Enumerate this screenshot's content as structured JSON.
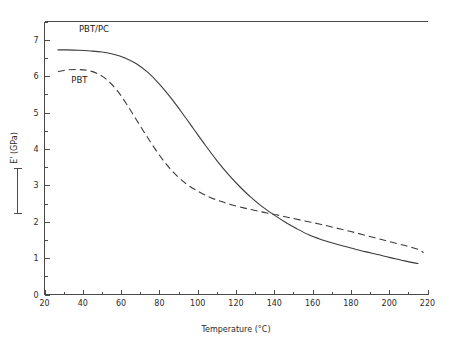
{
  "chart_data": {
    "type": "line",
    "title": "",
    "xlabel": "Temperature (°C)",
    "ylabel": "E' (GPa)",
    "xlim": [
      20,
      220
    ],
    "ylim": [
      0,
      7.5
    ],
    "xticks": [
      20,
      40,
      60,
      80,
      100,
      120,
      140,
      160,
      180,
      200,
      220
    ],
    "yticks": [
      0,
      1,
      2,
      3,
      4,
      5,
      6,
      7
    ],
    "xtick_labels": [
      "20",
      "40",
      "60",
      "80",
      "100",
      "120",
      "140",
      "160",
      "180",
      "200",
      "220"
    ],
    "ytick_labels": [
      "0",
      "1",
      "2",
      "3",
      "4",
      "5",
      "6",
      "7"
    ],
    "x_minor_tick_step": 10,
    "y_minor_tick_step": 0.5,
    "grid": false,
    "legend_position": "inline-annotations",
    "frame": "open-right",
    "series": [
      {
        "name": "PBT/PC",
        "style": "solid",
        "color": "#3b3b3b",
        "label_x": 38,
        "label_y": 7.22,
        "x": [
          27,
          32,
          38,
          44,
          50,
          56,
          62,
          68,
          74,
          80,
          86,
          92,
          98,
          104,
          110,
          116,
          122,
          128,
          134,
          140,
          146,
          152,
          158,
          164,
          170,
          176,
          182,
          188,
          194,
          200,
          206,
          211,
          215
        ],
        "y": [
          6.72,
          6.72,
          6.71,
          6.69,
          6.66,
          6.6,
          6.5,
          6.34,
          6.1,
          5.78,
          5.4,
          4.98,
          4.54,
          4.1,
          3.68,
          3.3,
          2.96,
          2.66,
          2.4,
          2.18,
          1.98,
          1.8,
          1.64,
          1.52,
          1.42,
          1.33,
          1.25,
          1.17,
          1.1,
          1.02,
          0.95,
          0.89,
          0.85
        ]
      },
      {
        "name": "PBT",
        "style": "dashed",
        "color": "#3b3b3b",
        "label_x": 34,
        "label_y": 5.8,
        "x": [
          27,
          32,
          38,
          43,
          48,
          53,
          58,
          63,
          68,
          73,
          78,
          83,
          88,
          94,
          100,
          106,
          112,
          118,
          124,
          130,
          136,
          142,
          148,
          156,
          164,
          172,
          180,
          188,
          196,
          204,
          210,
          215,
          218
        ],
        "y": [
          6.12,
          6.17,
          6.18,
          6.15,
          6.06,
          5.88,
          5.6,
          5.22,
          4.8,
          4.38,
          3.98,
          3.62,
          3.32,
          3.04,
          2.84,
          2.68,
          2.56,
          2.46,
          2.38,
          2.31,
          2.24,
          2.18,
          2.11,
          2.02,
          1.93,
          1.83,
          1.73,
          1.62,
          1.51,
          1.4,
          1.32,
          1.24,
          1.15
        ]
      }
    ],
    "annotations": [
      {
        "text": "PBT/PC",
        "name": "series-label-pbt-pc"
      },
      {
        "text": "PBT",
        "name": "series-label-pbt"
      }
    ],
    "ylabel_bracket": "[ ]"
  }
}
